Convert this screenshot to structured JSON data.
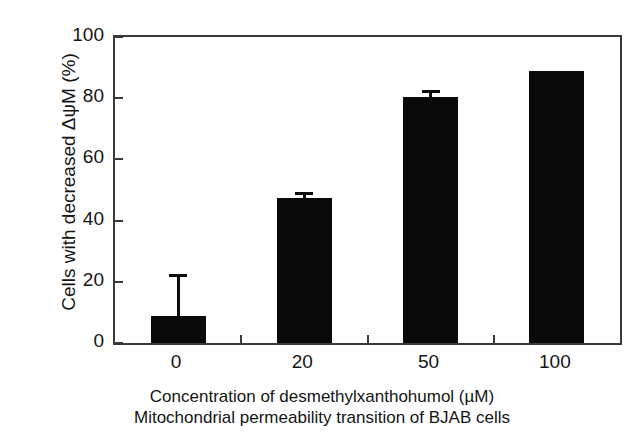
{
  "chart_data": {
    "type": "bar",
    "title": "",
    "subtitle": "Mitochondrial permeability transition of BJAB cells",
    "xlabel": "Concentration of desmethylxanthohumol (µM)",
    "ylabel": "Cells with decreased ΔψM (%)",
    "categories": [
      "0",
      "20",
      "50",
      "100"
    ],
    "values": [
      8.7,
      47.4,
      80.3,
      88.8
    ],
    "errors": [
      13.9,
      2.1,
      2.3,
      0
    ],
    "ylim": [
      0,
      100
    ],
    "yticks": [
      "0",
      "20",
      "40",
      "60",
      "80",
      "100"
    ],
    "ytick_values": [
      0,
      20,
      40,
      60,
      80,
      100
    ],
    "grid": false,
    "legend": "none",
    "bar_color": "#0a0a0a",
    "axis_color": "#3a3a3a",
    "background": "#ffffff"
  },
  "figure": {
    "xlabel": "Concentration of desmethylxanthohumol (µM)",
    "subcaption": "Mitochondrial permeability transition of BJAB cells",
    "ylabel": "Cells with decreased ΔψM (%)"
  }
}
